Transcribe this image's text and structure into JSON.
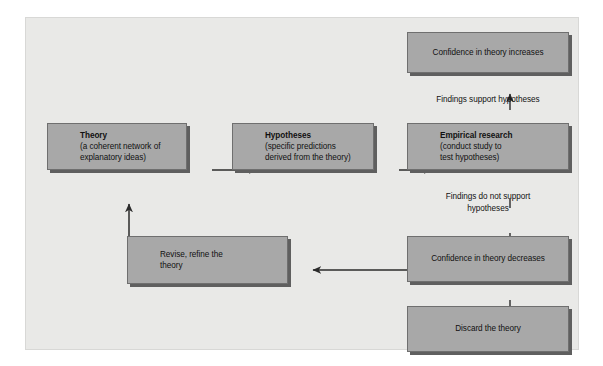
{
  "diagram": {
    "colors": {
      "panel_background": "#e9e9e7",
      "box_fill": "#a8a8a8",
      "box_border": "#6f6f6f",
      "box_shadow": "#5f5f5f",
      "text": "#111111",
      "arrow": "#2b2b2b"
    },
    "boxes": {
      "theory": {
        "title": "Theory",
        "line2": "(a coherent network of",
        "line3": "explanatory ideas)"
      },
      "hypotheses": {
        "title": "Hypotheses",
        "line2": "(specific predictions",
        "line3": "derived from the theory)"
      },
      "empirical_research": {
        "title": "Empirical research",
        "line2": "(conduct study to",
        "line3": "test hypotheses)"
      },
      "confidence_increases": {
        "text": "Confidence in theory increases"
      },
      "confidence_decreases": {
        "text": "Confidence in theory decreases"
      },
      "discard_theory": {
        "text": "Discard the theory"
      },
      "revise_theory": {
        "line1": "Revise, refine the",
        "line2": "theory"
      }
    },
    "labels": {
      "support": "Findings support hypotheses",
      "not_support_line1": "Findings do not support",
      "not_support_line2": "hypotheses"
    }
  }
}
